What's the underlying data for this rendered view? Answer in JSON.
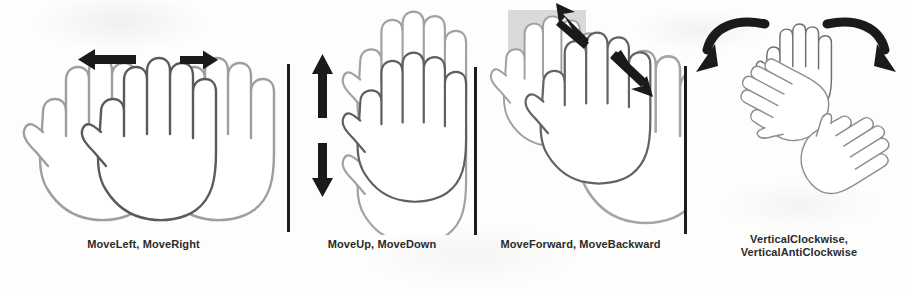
{
  "figure": {
    "width": 911,
    "height": 289,
    "background_color": "#fdfdfc",
    "caption_color": "#2b2b2b",
    "divider_color": "#1c1c1c",
    "hand_outline_light": "#9a9a9a",
    "hand_outline_dark": "#4f4f4f",
    "hand_fill": "#ffffff",
    "arrow_color": "#1a1a1a",
    "highlight_square_color": "#d9d9d9"
  },
  "panels": [
    {
      "id": "move-left-right",
      "caption": "MoveLeft,  MoveRight",
      "gesture_names": [
        "MoveLeft",
        "MoveRight"
      ],
      "hand_count": 3,
      "hand_layout": "horizontal-overlap",
      "arrows": [
        {
          "name": "arrow-left",
          "direction": "left",
          "style": "straight"
        },
        {
          "name": "arrow-right",
          "direction": "right",
          "style": "straight"
        }
      ],
      "highlight_square": false
    },
    {
      "id": "move-up-down",
      "caption": "MoveUp,  MoveDown",
      "gesture_names": [
        "MoveUp",
        "MoveDown"
      ],
      "hand_count": 3,
      "hand_layout": "vertical-overlap",
      "arrows": [
        {
          "name": "arrow-up",
          "direction": "up",
          "style": "straight"
        },
        {
          "name": "arrow-down",
          "direction": "down",
          "style": "straight"
        }
      ],
      "highlight_square": false
    },
    {
      "id": "move-forward-backward",
      "caption": "MoveForward,  MoveBackward",
      "gesture_names": [
        "MoveForward",
        "MoveBackward"
      ],
      "hand_count": 3,
      "hand_layout": "diagonal-overlap",
      "arrows": [
        {
          "name": "arrow-up-left",
          "direction": "up-left",
          "style": "straight"
        },
        {
          "name": "arrow-down-right",
          "direction": "down-right",
          "style": "straight"
        }
      ],
      "highlight_square": true
    },
    {
      "id": "vertical-clockwise-anticlockwise",
      "caption": "VerticalClockwise,\nVerticalAntiClockwise",
      "gesture_names": [
        "VerticalClockwise",
        "VerticalAntiClockwise"
      ],
      "hand_count": 3,
      "hand_layout": "rotational",
      "arrows": [
        {
          "name": "curved-arrow-left",
          "direction": "counter-clockwise",
          "style": "curved"
        },
        {
          "name": "curved-arrow-right",
          "direction": "clockwise",
          "style": "curved"
        }
      ],
      "highlight_square": false
    }
  ],
  "dividers": [
    {
      "name": "divider-1",
      "x": 287,
      "y": 64,
      "height": 168
    },
    {
      "name": "divider-2",
      "x": 474,
      "y": 67,
      "height": 168
    },
    {
      "name": "divider-3",
      "x": 684,
      "y": 66,
      "height": 168
    }
  ]
}
